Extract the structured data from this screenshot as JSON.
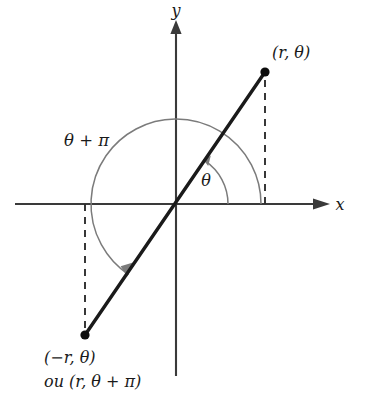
{
  "figure": {
    "background_color": "#ffffff",
    "width": 365,
    "height": 401
  },
  "axes": {
    "x_label": "x",
    "y_label": "y",
    "origin": {
      "x": 176,
      "y": 204
    },
    "x_axis": {
      "start_x": 15,
      "end_x": 330,
      "y": 204
    },
    "y_axis": {
      "x": 176,
      "start_y": 22,
      "end_y": 376
    },
    "axis_color": "#3a3a3a"
  },
  "points": [
    {
      "id": "point-upper",
      "label": "(r, θ)",
      "x": 265,
      "y": 72,
      "label_x": 272,
      "label_y": 58,
      "dot_color": "#0d0d0d"
    },
    {
      "id": "point-lower",
      "label_line1": "(−r, θ)",
      "label_line2": "ou (r, θ + π)",
      "x": 85,
      "y": 335,
      "label_x": 44,
      "label_y": 363,
      "label2_y": 387,
      "dot_color": "#0d0d0d"
    }
  ],
  "ray": {
    "name": "line-through-origin",
    "from_x": 85,
    "from_y": 335,
    "to_x": 265,
    "to_y": 72,
    "color": "#1a1a1a"
  },
  "dashed_segments": [
    {
      "id": "dashed-right",
      "x": 265,
      "from_y": 80,
      "to_y": 204
    },
    {
      "id": "dashed-left",
      "x": 85,
      "from_y": 204,
      "to_y": 329
    }
  ],
  "arcs": [
    {
      "id": "arc-theta-inner",
      "label": "θ",
      "label_x": 206,
      "label_y": 186,
      "radius": 52,
      "start_angle_deg": 0,
      "end_angle_deg": 56,
      "color": "#7b7b7b",
      "arrow_at": "end"
    },
    {
      "id": "arc-theta-plus-pi",
      "label": "θ + π",
      "label_x": 64,
      "label_y": 146,
      "radius": 85,
      "start_angle_deg": 0,
      "end_angle_deg": 236,
      "color": "#7b7b7b",
      "arrow_at": "end"
    }
  ],
  "annotations": {
    "theta_symbol": "θ",
    "pi_symbol": "π",
    "r_symbol": "r",
    "or_word": "ou"
  }
}
